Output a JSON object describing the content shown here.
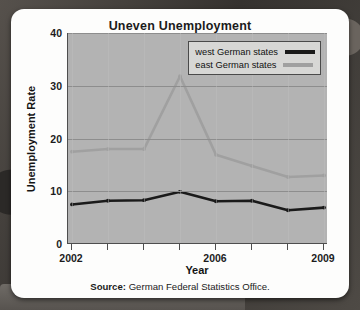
{
  "chart_data": {
    "type": "line",
    "title": "Uneven Unemployment",
    "xlabel": "Year",
    "ylabel": "Unemployment Rate",
    "x": [
      2002,
      2003,
      2004,
      2005,
      2006,
      2007,
      2008,
      2009
    ],
    "xtick_labels": [
      "2002",
      "",
      "",
      "",
      "2006",
      "",
      "",
      "2009"
    ],
    "ytick_labels": [
      "0",
      "10",
      "20",
      "30",
      "40"
    ],
    "yticks": [
      0,
      10,
      20,
      30,
      40
    ],
    "xlim": [
      2002,
      2009
    ],
    "ylim": [
      0,
      40
    ],
    "grid": "horizontal",
    "legend_position": "top-right",
    "series": [
      {
        "name": "west German states",
        "color": "#1a1a1a",
        "values": [
          7.5,
          8.2,
          8.3,
          9.9,
          8.1,
          8.2,
          6.4,
          6.9
        ]
      },
      {
        "name": "east German states",
        "color": "#a0a0a0",
        "values": [
          17.5,
          18.0,
          18.0,
          31.8,
          16.9,
          14.8,
          12.7,
          13.0
        ]
      }
    ],
    "source_prefix": "Source:",
    "source_text": "German Federal Statistics Office.",
    "plot_background": "#b3b3b3",
    "card_background": "#fdfdfc"
  }
}
